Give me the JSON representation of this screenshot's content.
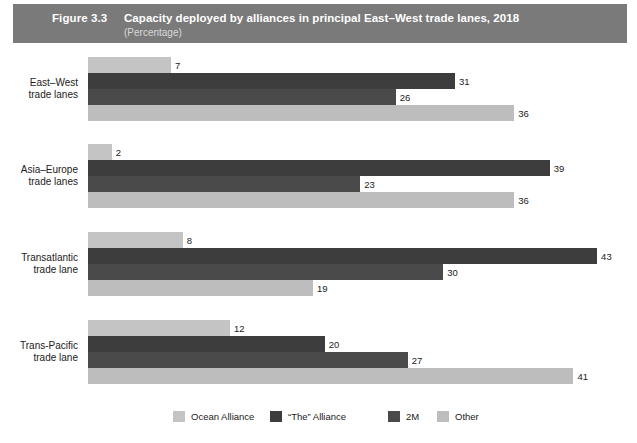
{
  "header": {
    "figure_number": "Figure 3.3",
    "title": "Capacity deployed by alliances in principal East–West trade lanes, 2018",
    "subtitle": "(Percentage)",
    "bar_color": "#7a7a7a",
    "text_color": "#ffffff",
    "subtitle_color": "#d9d9d9"
  },
  "chart_data": {
    "type": "bar",
    "orientation": "horizontal",
    "title": "Capacity deployed by alliances in principal East–West trade lanes, 2018",
    "subtitle": "(Percentage)",
    "xlabel": "",
    "ylabel": "",
    "xlim": [
      0,
      43
    ],
    "grid": false,
    "legend_position": "bottom",
    "categories": [
      "East–West trade lanes",
      "Asia–Europe trade lanes",
      "Transatlantic trade lane",
      "Trans-Pacific trade lane"
    ],
    "category_lines": [
      [
        "East–West",
        "trade lanes"
      ],
      [
        "Asia–Europe",
        "trade lanes"
      ],
      [
        "Transatlantic",
        "trade lane"
      ],
      [
        "Trans-Pacific",
        "trade lane"
      ]
    ],
    "series": [
      {
        "name": "Ocean Alliance",
        "color": "#c4c4c4",
        "values": [
          7,
          2,
          8,
          12
        ]
      },
      {
        "name": "“The” Alliance",
        "color": "#3d3d3d",
        "values": [
          31,
          39,
          43,
          20
        ]
      },
      {
        "name": "2M",
        "color": "#4a4a4a",
        "values": [
          26,
          23,
          30,
          27
        ]
      },
      {
        "name": "Other",
        "color": "#bdbdbd",
        "values": [
          36,
          36,
          19,
          41
        ]
      }
    ],
    "value_labels": {
      "group_0": [
        "7",
        "31",
        "26",
        "36"
      ],
      "group_1": [
        "2",
        "39",
        "23",
        "36"
      ],
      "group_2": [
        "8",
        "43",
        "30",
        "19"
      ],
      "group_3": [
        "12",
        "20",
        "27",
        "41"
      ]
    }
  },
  "legend": {
    "items": [
      {
        "label": "Ocean Alliance",
        "color": "#c4c4c4"
      },
      {
        "label": "“The” Alliance",
        "color": "#3d3d3d"
      },
      {
        "label": "2M",
        "color": "#4a4a4a"
      },
      {
        "label": "Other",
        "color": "#bdbdbd"
      }
    ]
  },
  "layout": {
    "bar_origin_x": 88,
    "px_per_unit": 11.84,
    "bar_height": 16,
    "group_tops": [
      14,
      101,
      189,
      277
    ],
    "legend_item_x": [
      173,
      270,
      388,
      437
    ]
  }
}
